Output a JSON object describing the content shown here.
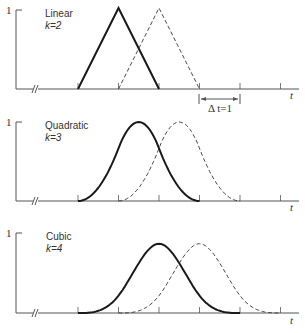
{
  "diagram": {
    "type": "B-spline basis functions",
    "y_tick_label": "1",
    "x_axis_label": "t",
    "knot_spacing_label": "Δ t=1",
    "panels": [
      {
        "name": "Linear",
        "order_label": "k=2",
        "k": 2,
        "solid_support": [
          0,
          2
        ],
        "dashed_support": [
          1,
          3
        ],
        "peak": 1.0
      },
      {
        "name": "Quadratic",
        "order_label": "k=3",
        "k": 3,
        "solid_support": [
          0,
          3
        ],
        "dashed_support": [
          1,
          4
        ],
        "peak": 0.75
      },
      {
        "name": "Cubic",
        "order_label": "k=4",
        "k": 4,
        "solid_support": [
          0,
          4
        ],
        "dashed_support": [
          1,
          5
        ],
        "peak": 0.667
      }
    ],
    "knots": [
      0,
      1,
      2,
      3,
      4,
      5
    ],
    "line_color": "#1a1a1a",
    "axis_color": "#555555"
  }
}
